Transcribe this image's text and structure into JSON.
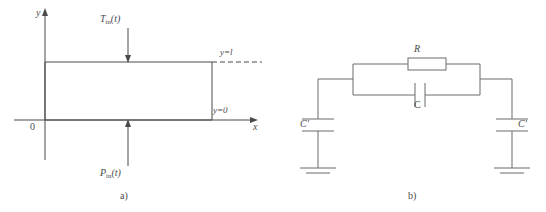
{
  "figure": {
    "stroke_color": "#4a4a4a",
    "background": "#ffffff"
  },
  "panel_a": {
    "caption": "a)",
    "axes": {
      "y_axis_label": "y",
      "x_axis_label": "x",
      "origin_label": "0"
    },
    "inputs": {
      "top_symbol": "T",
      "top_subscript": "in",
      "top_argument": "(t)",
      "bottom_symbol": "P",
      "bottom_subscript": "in",
      "bottom_argument": "(t)"
    },
    "boundaries": {
      "top_label": "y=l",
      "bottom_label": "y=0"
    }
  },
  "panel_b": {
    "caption": "b)",
    "components": {
      "resistor_label": "R",
      "series_capacitor_label": "C",
      "left_shunt_capacitor_label": "C'",
      "right_shunt_capacitor_label": "C'"
    }
  }
}
